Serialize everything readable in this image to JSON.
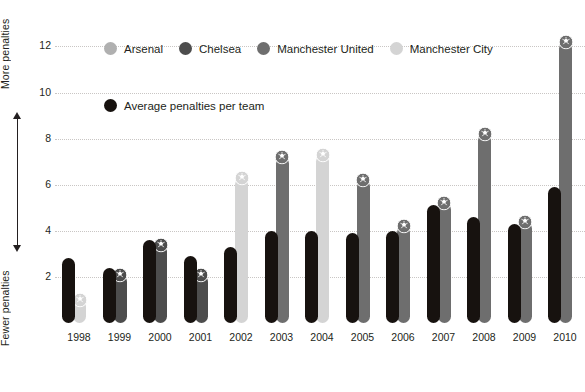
{
  "axis_annotation": {
    "top_label": "More penalties",
    "bottom_label": "Fewer penalties",
    "arrow_icon": "double-headed-vertical-arrow"
  },
  "legend_clubs": [
    {
      "label": "Arsenal",
      "color": "#b0b0b0"
    },
    {
      "label": "Chelsea",
      "color": "#4d4d4d"
    },
    {
      "label": "Manchester United",
      "color": "#6e6e6e"
    },
    {
      "label": "Manchester City",
      "color": "#d4d4d4"
    }
  ],
  "legend_average": {
    "label": "Average penalties per team",
    "color": "#17120f"
  },
  "chart_data": {
    "type": "bar",
    "title": "",
    "subtitle": "",
    "xlabel": "",
    "ylabel": "",
    "ylim": [
      0,
      12.8
    ],
    "yticks": [
      2,
      4,
      6,
      8,
      10,
      12
    ],
    "grid": true,
    "legend_position": "top",
    "marker": "football-icon",
    "categories": [
      "1998",
      "1999",
      "2000",
      "2001",
      "2002",
      "2003",
      "2004",
      "2005",
      "2006",
      "2007",
      "2008",
      "2009",
      "2010"
    ],
    "series": [
      {
        "name": "Average penalties per team",
        "color": "#17120f",
        "values": [
          2.8,
          2.4,
          3.6,
          2.9,
          3.3,
          4.0,
          4.0,
          3.9,
          4.0,
          5.1,
          4.6,
          4.3,
          5.9
        ]
      },
      {
        "name": "Top club penalties",
        "clubs": [
          "Manchester City",
          "Chelsea",
          "Chelsea",
          "Chelsea",
          "Manchester City",
          "Manchester United",
          "Manchester City",
          "Manchester United",
          "Manchester United",
          "Manchester United",
          "Manchester United",
          "Manchester United",
          "Manchester United"
        ],
        "colors": [
          "#d4d4d4",
          "#4d4d4d",
          "#4d4d4d",
          "#4d4d4d",
          "#d4d4d4",
          "#6e6e6e",
          "#d4d4d4",
          "#6e6e6e",
          "#6e6e6e",
          "#6e6e6e",
          "#6e6e6e",
          "#6e6e6e",
          "#6e6e6e"
        ],
        "values": [
          1.0,
          2.1,
          3.4,
          2.1,
          6.3,
          7.2,
          7.3,
          6.2,
          4.2,
          5.2,
          8.2,
          4.4,
          12.2
        ]
      }
    ]
  }
}
